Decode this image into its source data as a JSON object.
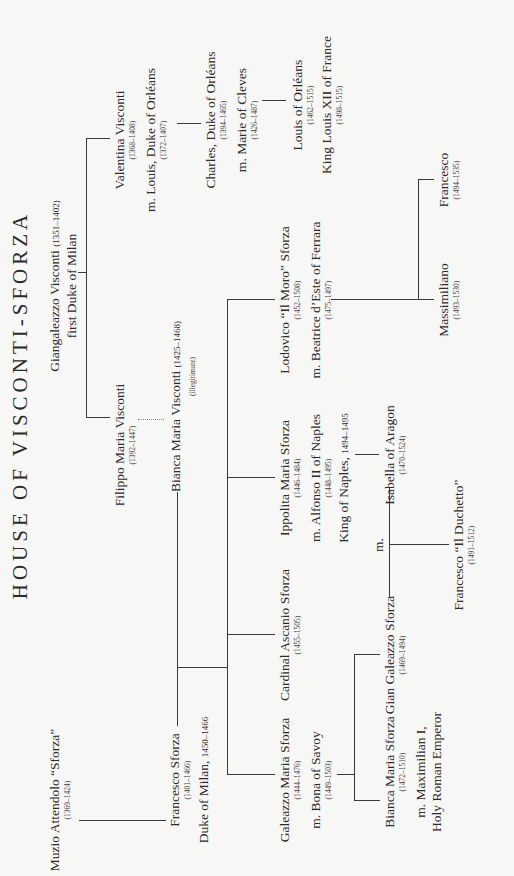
{
  "title": "HOUSE OF VISCONTI-SFORZA",
  "people": {
    "giangaleazzo": {
      "name": "Giangaleazzo Visconti",
      "dates": "(1351–1402)",
      "title": "first Duke of Milan"
    },
    "valentina": {
      "name": "Valentina Visconti",
      "dates": "(1368–1408)",
      "spouse": "m. Louis, Duke of Orléans",
      "spouse_dates": "(1372–1407)"
    },
    "charles": {
      "name": "Charles, Duke of Orléans",
      "dates": "(1394–1465)",
      "spouse": "m. Marie of Cleves",
      "spouse_dates": "(1426–1487)"
    },
    "louis": {
      "name": "Louis of Orléans",
      "dates": "(1462–1515)",
      "title": "King Louis XII of France",
      "title_dates": "(1498–1515)"
    },
    "filippo": {
      "name": "Filippo Maria Visconti",
      "dates": "(1392–1447)"
    },
    "bianca_visconti": {
      "name": "Bianca Maria Visconti",
      "dates": "(1425–1468)",
      "note": "(illegitimate)"
    },
    "muzio": {
      "name": "Muzio Attendolo “Sforza”",
      "dates": "(1369–1424)"
    },
    "francesco": {
      "name": "Francesco Sforza",
      "dates": "(1401–1466)",
      "title": "Duke of Milan,",
      "title_dates": "1450–1466"
    },
    "galeazzo": {
      "name": "Galeazzo Maria Sforza",
      "dates": "(1444–1476)",
      "spouse": "m. Bona of Savoy",
      "spouse_dates": "(1449–1503)"
    },
    "ascanio": {
      "name": "Cardinal Ascanio Sforza",
      "dates": "(1455–1505)"
    },
    "ippolita": {
      "name": "Ippolita Maria Sforza",
      "dates": "(1446–1484)",
      "spouse": "m. Alfonso II of Naples",
      "spouse_dates": "(1448–1495)",
      "title": "King of Naples,",
      "title_dates": "1494–1495"
    },
    "lodovico": {
      "name": "Lodovico “Il Moro” Sforza",
      "dates": "(1452–1508)",
      "spouse": "m. Beatrice d’Este of Ferrara",
      "spouse_dates": "(1475–1497)"
    },
    "gian_galeazzo": {
      "name": "Gian Galeazzo Sforza",
      "dates": "(1469–1494)"
    },
    "bianca_sforza": {
      "name": "Bianca Maria Sforza",
      "dates": "(1472–1510)",
      "spouse": "m. Maximilian I,",
      "spouse_title": "Holy Roman Emperor"
    },
    "isabella": {
      "name": "Isabella of Aragon",
      "dates": "(1470–1524)"
    },
    "marriage_label": "m.",
    "duchetto": {
      "name": "Francesco “Il Duchetto”",
      "dates": "(1491–1512)"
    },
    "massimiliano": {
      "name": "Massimiliano",
      "dates": "(1493–1530)"
    },
    "francesco_1494": {
      "name": "Francesco",
      "dates": "(1494–1535)"
    }
  }
}
